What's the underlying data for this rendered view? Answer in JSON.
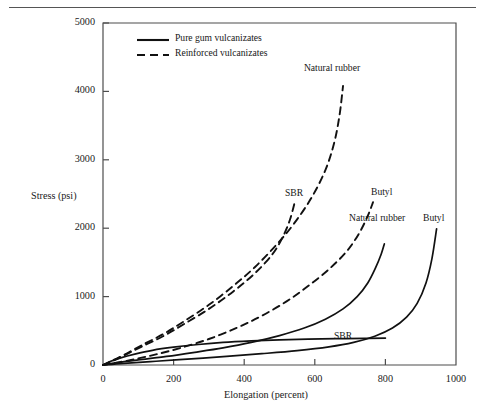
{
  "figure": {
    "background": "#ffffff",
    "line_color": "#111111",
    "axis_color": "#4d4d4d",
    "has_top_rule": true
  },
  "chart_data": {
    "type": "line",
    "title": "",
    "xlabel": "Elongation (percent)",
    "ylabel": "Stress (psi)",
    "xlim": [
      0,
      1000
    ],
    "ylim": [
      0,
      5000
    ],
    "xticks": [
      0,
      200,
      400,
      600,
      800,
      1000
    ],
    "xtick_labels": [
      "0",
      "200",
      "400",
      "600",
      "800",
      "1000"
    ],
    "yticks": [
      0,
      1000,
      2000,
      3000,
      4000,
      5000
    ],
    "ytick_labels": [
      "0",
      "1000",
      "2000",
      "3000",
      "4000",
      "5000"
    ],
    "grid": false,
    "legend_position": "upper-left-inside",
    "legend": [
      {
        "label": "Pure gum vulcanizates",
        "style": "solid"
      },
      {
        "label": "Reinforced vulcanizates",
        "style": "dashed"
      }
    ],
    "series": [
      {
        "name": "Natural rubber (reinforced)",
        "style": "dashed",
        "label": "Natural rubber",
        "points": [
          [
            0,
            0
          ],
          [
            25,
            60
          ],
          [
            60,
            150
          ],
          [
            110,
            290
          ],
          [
            170,
            450
          ],
          [
            230,
            640
          ],
          [
            300,
            880
          ],
          [
            370,
            1160
          ],
          [
            430,
            1430
          ],
          [
            490,
            1750
          ],
          [
            540,
            2060
          ],
          [
            590,
            2440
          ],
          [
            630,
            2850
          ],
          [
            655,
            3250
          ],
          [
            670,
            3650
          ],
          [
            680,
            4080
          ]
        ]
      },
      {
        "name": "SBR (reinforced)",
        "style": "dashed",
        "label": "SBR",
        "points": [
          [
            0,
            0
          ],
          [
            25,
            55
          ],
          [
            60,
            140
          ],
          [
            110,
            270
          ],
          [
            170,
            420
          ],
          [
            230,
            600
          ],
          [
            300,
            820
          ],
          [
            370,
            1080
          ],
          [
            430,
            1340
          ],
          [
            480,
            1620
          ],
          [
            510,
            1880
          ],
          [
            530,
            2130
          ],
          [
            545,
            2420
          ]
        ]
      },
      {
        "name": "Butyl (reinforced)",
        "style": "dashed",
        "label": "Butyl",
        "points": [
          [
            0,
            0
          ],
          [
            40,
            35
          ],
          [
            90,
            85
          ],
          [
            150,
            155
          ],
          [
            220,
            250
          ],
          [
            300,
            380
          ],
          [
            380,
            545
          ],
          [
            450,
            720
          ],
          [
            520,
            930
          ],
          [
            580,
            1150
          ],
          [
            640,
            1400
          ],
          [
            690,
            1660
          ],
          [
            725,
            1920
          ],
          [
            750,
            2180
          ],
          [
            765,
            2380
          ]
        ]
      },
      {
        "name": "Natural rubber (pure gum)",
        "style": "solid",
        "label": "Natural rubber",
        "points": [
          [
            0,
            0
          ],
          [
            40,
            35
          ],
          [
            100,
            75
          ],
          [
            180,
            125
          ],
          [
            260,
            185
          ],
          [
            340,
            250
          ],
          [
            420,
            330
          ],
          [
            500,
            430
          ],
          [
            570,
            540
          ],
          [
            630,
            670
          ],
          [
            680,
            820
          ],
          [
            720,
            1000
          ],
          [
            750,
            1200
          ],
          [
            772,
            1420
          ],
          [
            788,
            1620
          ],
          [
            797,
            1770
          ]
        ]
      },
      {
        "name": "Butyl (pure gum)",
        "style": "solid",
        "label": "Butyl",
        "points": [
          [
            0,
            0
          ],
          [
            60,
            25
          ],
          [
            150,
            55
          ],
          [
            250,
            90
          ],
          [
            350,
            125
          ],
          [
            450,
            165
          ],
          [
            550,
            210
          ],
          [
            640,
            265
          ],
          [
            710,
            330
          ],
          [
            770,
            420
          ],
          [
            820,
            540
          ],
          [
            860,
            700
          ],
          [
            890,
            900
          ],
          [
            915,
            1200
          ],
          [
            932,
            1560
          ],
          [
            945,
            1990
          ]
        ]
      },
      {
        "name": "SBR (pure gum)",
        "style": "solid",
        "label": "SBR",
        "points": [
          [
            0,
            0
          ],
          [
            20,
            50
          ],
          [
            50,
            105
          ],
          [
            90,
            160
          ],
          [
            140,
            215
          ],
          [
            200,
            260
          ],
          [
            270,
            300
          ],
          [
            340,
            330
          ],
          [
            420,
            352
          ],
          [
            500,
            368
          ],
          [
            580,
            378
          ],
          [
            660,
            385
          ],
          [
            740,
            390
          ],
          [
            800,
            393
          ]
        ]
      }
    ],
    "annotations": [
      {
        "text": "Natural rubber",
        "series": "Natural rubber (reinforced)",
        "x_px": 331,
        "y_px": 67
      },
      {
        "text": "SBR",
        "series": "SBR (reinforced)",
        "x_px": 285,
        "y_px": 187
      },
      {
        "text": "Butyl",
        "series": "Butyl (reinforced)",
        "x_px": 371,
        "y_px": 186
      },
      {
        "text": "Natural rubber",
        "series": "Natural rubber (pure gum)",
        "x_px": 371,
        "y_px": 212
      },
      {
        "text": "Butyl",
        "series": "Butyl (pure gum)",
        "x_px": 423,
        "y_px": 212
      },
      {
        "text": "SBR",
        "series": "SBR (pure gum)",
        "x_px": 334,
        "y_px": 330
      }
    ]
  }
}
